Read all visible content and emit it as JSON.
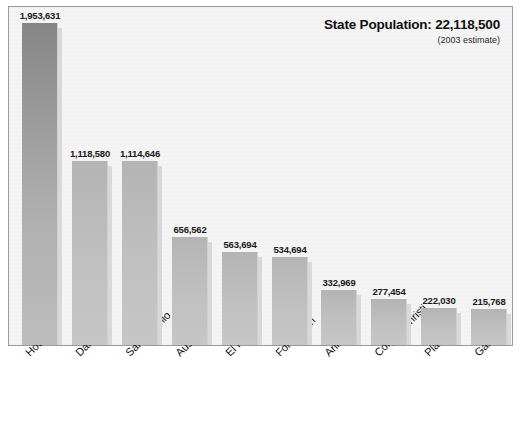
{
  "header": {
    "title": "State Population: 22,118,500",
    "subtitle": "(2003 estimate)"
  },
  "chart_data": {
    "type": "bar",
    "title": "State Population: 22,118,500",
    "subtitle": "(2003 estimate)",
    "xlabel": "",
    "ylabel": "",
    "grid": false,
    "legend": false,
    "ylim": [
      0,
      1953631
    ],
    "categories": [
      "Houston",
      "Dallas",
      "San Antonio",
      "Austin",
      "El Paso",
      "Fort Worth",
      "Arlington",
      "Corpus Christi",
      "Plano",
      "Garland"
    ],
    "values": [
      1953631,
      1118580,
      1114646,
      656562,
      563694,
      534694,
      332969,
      277454,
      222030,
      215768
    ],
    "value_labels": [
      "1,953,631",
      "1,118,580",
      "1,114,646",
      "656,562",
      "563,694",
      "534,694",
      "332,969",
      "277,454",
      "222,030",
      "215,768"
    ],
    "annotations": [
      "State Population: 22,118,500",
      "(2003 estimate)"
    ],
    "colors": {
      "bar_top": "#868686",
      "bar_bottom": "#c6c6c6",
      "bar_shadow": "#d8d8d8",
      "plot_background": "#f4f4f4",
      "frame_border": "#9a9a9a",
      "text": "#111111"
    }
  }
}
